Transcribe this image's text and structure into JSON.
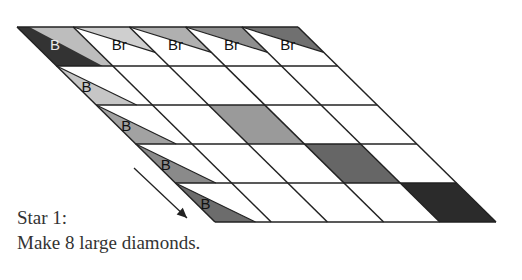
{
  "caption": {
    "line1": "Star 1:",
    "line2": "Make 8 large diamonds."
  },
  "grid": {
    "rows": 5,
    "cols": 5,
    "top_left": [
      17,
      27
    ],
    "col_width": 56.2,
    "row_height": 39,
    "row_shift": 39.6,
    "line_color": "#222222"
  },
  "top_row_labels": [
    "B",
    "Br",
    "Br",
    "Br",
    "Br"
  ],
  "left_column_labels": [
    "B",
    "B",
    "B",
    "B",
    "B"
  ],
  "fills": {
    "corner_dark": "#333333",
    "corner_light": "#bdbdbd",
    "top_row_triangles": [
      "#cfcfcf",
      "#b0b0b0",
      "#8f8f8f",
      "#707070"
    ],
    "left_col_triangles": [
      "#c6c6c6",
      "#a2a2a2",
      "#8a8a8a",
      "#6c6c6c"
    ],
    "diagonal_cells": [
      {
        "row": 2,
        "col": 2,
        "color": "#9a9a9a"
      },
      {
        "row": 3,
        "col": 3,
        "color": "#666666"
      },
      {
        "row": 4,
        "col": 4,
        "color": "#2b2b2b"
      }
    ]
  },
  "arrow": {
    "from": [
      134,
      168
    ],
    "to": [
      187,
      218
    ],
    "color": "#222222",
    "direction": "down-right"
  }
}
